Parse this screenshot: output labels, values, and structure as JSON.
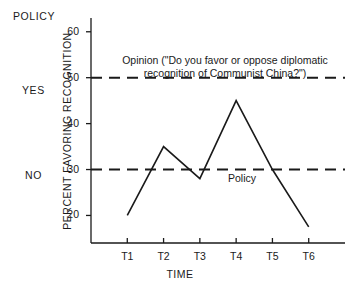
{
  "policy_scale": {
    "header": "POLICY",
    "yes_label": "YES",
    "no_label": "NO"
  },
  "annotations": {
    "opinion_line1": "Opinion (\"Do you favor or oppose diplomatic",
    "opinion_line2": "recognition of Communist China?\")",
    "policy_line": "Policy"
  },
  "chart_data": {
    "type": "line",
    "title": "",
    "xlabel": "TIME",
    "ylabel": "PERCENT FAVORING RECOGNITION",
    "categories": [
      "T1",
      "T2",
      "T3",
      "T4",
      "T5",
      "T6"
    ],
    "series": [
      {
        "name": "Opinion",
        "values": [
          20,
          35,
          28,
          45,
          30,
          17.5
        ],
        "style": "solid"
      }
    ],
    "reference_lines": [
      {
        "name": "Opinion",
        "value": 50,
        "style": "dashed",
        "axis_label": "YES"
      },
      {
        "name": "Policy",
        "value": 30,
        "style": "dashed",
        "axis_label": "NO"
      }
    ],
    "yticks": [
      20,
      30,
      40,
      50,
      60
    ],
    "ytick_labels": [
      "20",
      "30",
      "40",
      "50",
      "60"
    ],
    "ylim": [
      14,
      63
    ],
    "xlim": [
      0,
      7
    ],
    "grid": false,
    "legend": "none",
    "line_color": "#1a1a1a"
  }
}
